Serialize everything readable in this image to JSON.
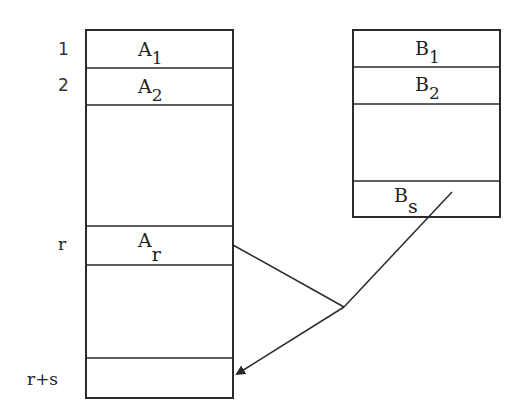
{
  "diagram": {
    "type": "memory-array-merge",
    "stroke_color": "#2a2a2a",
    "background": "#ffffff",
    "left_array": {
      "name": "A",
      "row_labels": [
        "1",
        "2",
        "r",
        "r+s"
      ],
      "cells": [
        {
          "base": "A",
          "sub": "1"
        },
        {
          "base": "A",
          "sub": "2"
        },
        {
          "base": "A",
          "sub": "r"
        }
      ]
    },
    "right_array": {
      "name": "B",
      "cells": [
        {
          "base": "B",
          "sub": "1"
        },
        {
          "base": "B",
          "sub": "2"
        },
        {
          "base": "B",
          "sub": "s"
        }
      ]
    },
    "arrow": {
      "description": "Lines from A_r and B_s converge and point to row r+s of array A"
    }
  }
}
